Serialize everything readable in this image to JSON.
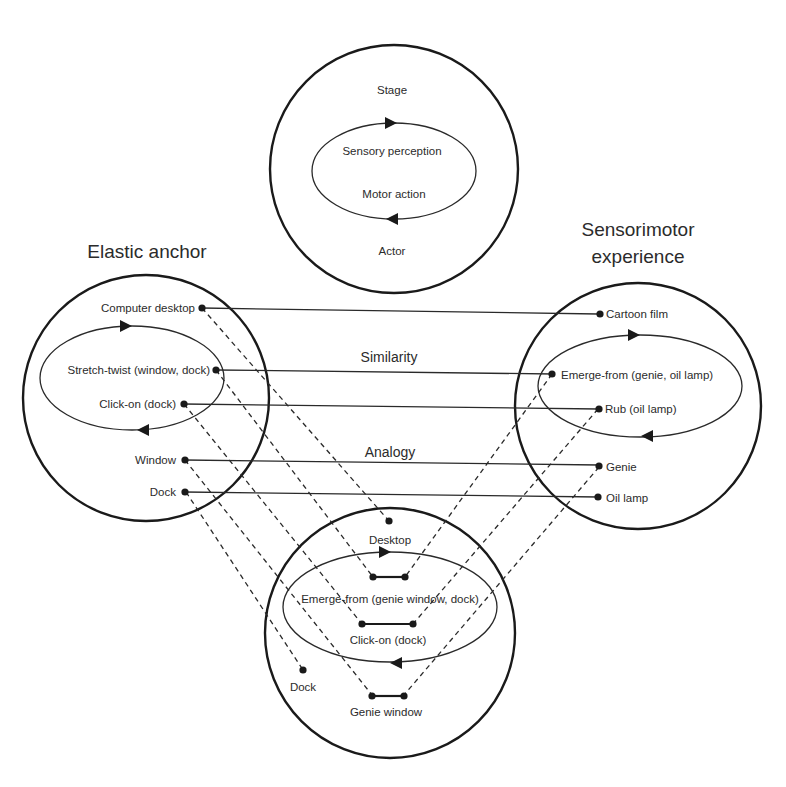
{
  "diagram": {
    "top_circle": {
      "outer_top_label": "Stage",
      "inner_top_label": "Sensory perception",
      "inner_bottom_label": "Motor action",
      "outer_bottom_label": "Actor"
    },
    "left_circle": {
      "title": "Elastic anchor",
      "items": [
        {
          "label": "Computer desktop"
        },
        {
          "label": "Stretch-twist (window, dock)"
        },
        {
          "label": "Click-on (dock)"
        },
        {
          "label": "Window"
        },
        {
          "label": "Dock"
        }
      ]
    },
    "right_circle": {
      "title_line1": "Sensorimotor",
      "title_line2": "experience",
      "items": [
        {
          "label": "Cartoon film"
        },
        {
          "label": "Emerge-from (genie, oil lamp)"
        },
        {
          "label": "Rub (oil lamp)"
        },
        {
          "label": "Genie"
        },
        {
          "label": "Oil lamp"
        }
      ]
    },
    "bottom_circle": {
      "items": [
        {
          "label": "Desktop"
        },
        {
          "label": "Emerge-from (genie window, dock)"
        },
        {
          "label": "Click-on (dock)"
        },
        {
          "label": "Dock"
        },
        {
          "label": "Genie window"
        }
      ]
    },
    "relations": {
      "similarity_label": "Similarity",
      "analogy_label": "Analogy"
    },
    "connections": {
      "solid_similarity": [
        [
          "Computer desktop",
          "Cartoon film"
        ],
        [
          "Stretch-twist (window, dock)",
          "Emerge-from (genie, oil lamp)"
        ],
        [
          "Click-on (dock)",
          "Rub (oil lamp)"
        ],
        [
          "Window",
          "Genie"
        ],
        [
          "Dock",
          "Oil lamp"
        ]
      ],
      "dashed_blend": [
        [
          "Computer desktop",
          "Desktop"
        ],
        [
          "Stretch-twist (window, dock)",
          "Emerge-from (genie window, dock)"
        ],
        [
          "Click-on (dock)",
          "Click-on (dock)"
        ],
        [
          "Window",
          "Genie window"
        ],
        [
          "Dock",
          "Dock"
        ],
        [
          "Emerge-from (genie, oil lamp)",
          "Emerge-from (genie window, dock)"
        ],
        [
          "Rub (oil lamp)",
          "Click-on (dock)"
        ],
        [
          "Genie",
          "Genie window"
        ]
      ]
    }
  }
}
